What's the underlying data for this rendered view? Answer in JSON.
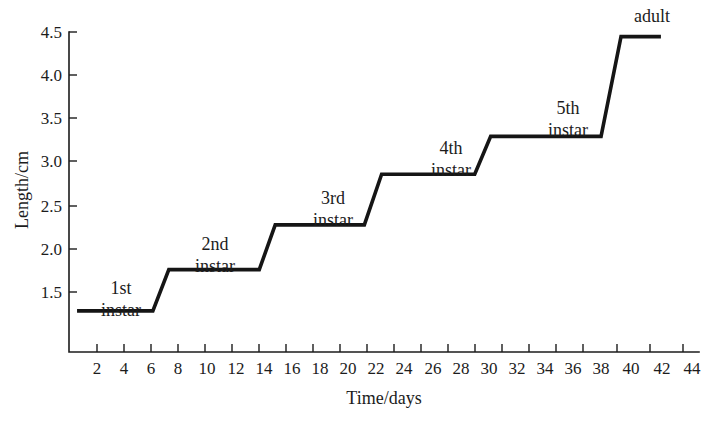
{
  "chart_data": {
    "type": "line",
    "title": "",
    "xlabel": "Time/days",
    "ylabel": "Length/cm",
    "xlim": [
      0,
      45
    ],
    "ylim": [
      1.1,
      4.62
    ],
    "grid": false,
    "legend": "none",
    "x_ticks": [
      2,
      4,
      6,
      8,
      10,
      12,
      14,
      16,
      18,
      20,
      22,
      24,
      26,
      28,
      30,
      32,
      34,
      36,
      38,
      40,
      42,
      44
    ],
    "y_ticks": [
      1.5,
      2.0,
      2.5,
      3.0,
      3.5,
      4.0,
      4.5
    ],
    "y_tick_labels": [
      "1.5",
      "2.0",
      "2.5",
      "3.0",
      "3.5",
      "4.0",
      "4.5"
    ],
    "series": [
      {
        "name": "body length",
        "x": [
          0.5,
          6.2,
          7.4,
          14.2,
          15.4,
          22.1,
          23.4,
          30.4,
          31.6,
          39.9,
          41.4,
          44.4
        ],
        "y": [
          1.28,
          1.28,
          1.76,
          1.76,
          2.28,
          2.28,
          2.87,
          2.87,
          3.31,
          3.31,
          4.47,
          4.47
        ]
      }
    ],
    "plateaus": [
      {
        "stage": "1st instar",
        "length_cm": 1.28,
        "day_start": 0.5,
        "day_end": 6.2
      },
      {
        "stage": "2nd instar",
        "length_cm": 1.76,
        "day_start": 7.4,
        "day_end": 14.2
      },
      {
        "stage": "3rd instar",
        "length_cm": 2.28,
        "day_start": 15.4,
        "day_end": 22.1
      },
      {
        "stage": "4th instar",
        "length_cm": 2.87,
        "day_start": 23.4,
        "day_end": 30.4
      },
      {
        "stage": "5th instar",
        "length_cm": 3.31,
        "day_start": 31.6,
        "day_end": 39.9
      },
      {
        "stage": "adult",
        "length_cm": 4.47,
        "day_start": 41.4,
        "day_end": 44.4
      }
    ],
    "annotations": [
      {
        "text_line1": "1st",
        "text_line2": "instar",
        "day": 4.0,
        "length_cm": 1.72
      },
      {
        "text_line1": "2nd",
        "text_line2": "instar",
        "day": 11.2,
        "length_cm": 2.22
      },
      {
        "text_line1": "3rd",
        "text_line2": "instar",
        "day": 19.0,
        "length_cm": 2.76
      },
      {
        "text_line1": "4th",
        "text_line2": "instar",
        "day": 27.4,
        "length_cm": 3.34
      },
      {
        "text_line1": "5th",
        "text_line2": "instar",
        "day": 35.9,
        "length_cm": 3.8
      },
      {
        "text_line1": "adult",
        "text_line2": "",
        "day": 41.9,
        "length_cm": 4.62
      }
    ]
  },
  "axes": {
    "y_title": "Length/cm",
    "x_title": "Time/days"
  },
  "y_labels": {
    "t0": "1.5",
    "t1": "2.0",
    "t2": "2.5",
    "t3": "3.0",
    "t4": "3.5",
    "t5": "4.0",
    "t6": "4.5"
  },
  "x_labels": {
    "t0": "2",
    "t1": "4",
    "t2": "6",
    "t3": "8",
    "t4": "10",
    "t5": "12",
    "t6": "14",
    "t7": "16",
    "t8": "18",
    "t9": "20",
    "t10": "22",
    "t11": "24",
    "t12": "26",
    "t13": "28",
    "t14": "30",
    "t15": "32",
    "t16": "34",
    "t17": "36",
    "t18": "38",
    "t19": "40",
    "t20": "42",
    "t21": "44"
  },
  "stage_labels": {
    "s0_line1": "1st",
    "s0_line2": "instar",
    "s1_line1": "2nd",
    "s1_line2": "instar",
    "s2_line1": "3rd",
    "s2_line2": "instar",
    "s3_line1": "4th",
    "s3_line2": "instar",
    "s4_line1": "5th",
    "s4_line2": "instar",
    "s5_line1": "adult"
  },
  "colors": {
    "background": "#ffffff",
    "ink": "#1c1c1c",
    "curve": "#151515"
  }
}
